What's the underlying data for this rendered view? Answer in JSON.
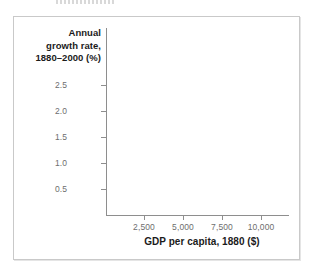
{
  "figure": {
    "top_clipped_artifact": "",
    "background_color": "#ffffff",
    "frame_border_color": "#c9c9c9",
    "axis_color": "#8e8e8e",
    "tick_label_color": "#6e6e6e",
    "axis_title_color": "#1b1b1b"
  },
  "chart_data": {
    "type": "scatter",
    "title": "",
    "xlabel": "GDP per capita, 1880 ($)",
    "ylabel": "Annual growth rate, 1880–2000 (%)",
    "ylabel_lines": [
      "Annual",
      "growth rate,",
      "1880–2000 (%)"
    ],
    "xtick_labels": [
      "2,500",
      "5,000",
      "7,500",
      "10,000"
    ],
    "xticks": [
      2500,
      5000,
      7500,
      10000
    ],
    "ytick_labels": [
      "0.5",
      "1.0",
      "1.5",
      "2.0",
      "2.5"
    ],
    "yticks": [
      0.5,
      1.0,
      1.5,
      2.0,
      2.5
    ],
    "xlim": [
      0,
      11500
    ],
    "ylim": [
      0,
      2.75
    ],
    "grid": false,
    "legend": null,
    "series": [
      {
        "name": "",
        "x": [],
        "y": []
      }
    ],
    "annotations": []
  }
}
